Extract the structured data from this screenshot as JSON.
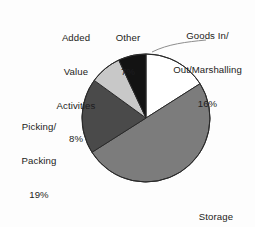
{
  "chart_data": {
    "type": "pie",
    "title": "",
    "subtitle": "",
    "xlabel": "",
    "ylabel": "",
    "legend_position": "labels-outside",
    "grid": false,
    "start_angle_deg": 0,
    "direction": "clockwise",
    "categories": [
      "Goods In/Out/Marshalling",
      "Storage",
      "Picking/Packing",
      "Added Value Activities",
      "Other"
    ],
    "values": [
      16,
      50,
      19,
      8,
      7
    ],
    "value_unit": "%",
    "slices": [
      {
        "id": "goods-in",
        "label_line1": "Goods In/",
        "label_line2": "Out/Marshalling",
        "value": 16,
        "value_text": "16%",
        "color": "#ffffff",
        "stroke": "#2a2a2a",
        "start_deg": 0,
        "end_deg": 57.6
      },
      {
        "id": "storage",
        "label_line1": "Storage",
        "label_line2": "",
        "value": 50,
        "value_text": "50%",
        "color": "#7c7c7c",
        "stroke": "#2a2a2a",
        "start_deg": 57.6,
        "end_deg": 237.6
      },
      {
        "id": "picking-packing",
        "label_line1": "Picking/",
        "label_line2": "Packing",
        "value": 19,
        "value_text": "19%",
        "color": "#4a4a4a",
        "stroke": "#2a2a2a",
        "start_deg": 237.6,
        "end_deg": 306.0
      },
      {
        "id": "added-value",
        "label_line1": "Added",
        "label_line2": "Value",
        "label_line3": "Activities",
        "value": 8,
        "value_text": "8%",
        "color": "#c8c8c8",
        "stroke": "#2a2a2a",
        "start_deg": 306.0,
        "end_deg": 334.8
      },
      {
        "id": "other",
        "label_line1": "Other",
        "label_line2": "",
        "value": 7,
        "value_text": "7%",
        "color": "#131313",
        "stroke": "#2a2a2a",
        "start_deg": 334.8,
        "end_deg": 360.0
      }
    ],
    "geometry": {
      "center_x": 146,
      "center_y": 118,
      "radius": 64
    },
    "colors": {
      "background": "#fdfdfd",
      "text": "#1c1c20",
      "outline": "#2a2a2a"
    }
  }
}
